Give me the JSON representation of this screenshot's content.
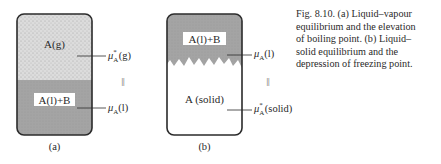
{
  "figure": {
    "panel_a": {
      "top_region_label": "A(g)",
      "bottom_region_label": "A(l)+B",
      "top_potential": {
        "symbol": "μ",
        "sup": "*",
        "sub": "A",
        "phase": "(g)"
      },
      "bottom_potential": {
        "symbol": "μ",
        "sub": "A",
        "phase": "(l)"
      },
      "equality": "||",
      "panel_label": "(a)"
    },
    "panel_b": {
      "top_region_label": "A(l)+B",
      "bottom_region_label": "A (solid)",
      "top_potential": {
        "symbol": "μ",
        "sub": "A",
        "phase": "(l)"
      },
      "bottom_potential": {
        "symbol": "μ",
        "sup": "*",
        "sub": "A",
        "phase": "(solid)"
      },
      "equality": "||",
      "panel_label": "(b)"
    },
    "caption": {
      "lines": [
        "Fig. 8.10. (a) Liquid–vapour",
        "equilibrium and the elevation",
        "of boiling point. (b) Liquid–",
        "solid equilibrium and the",
        "depression of freezing point."
      ]
    },
    "colors": {
      "gas_fill": "#d9d9d9",
      "liquid_fill": "#a3a3a3",
      "solid_fill": "#ffffff",
      "outline": "#2b2b2b",
      "label_bg": "#ffffff"
    }
  }
}
